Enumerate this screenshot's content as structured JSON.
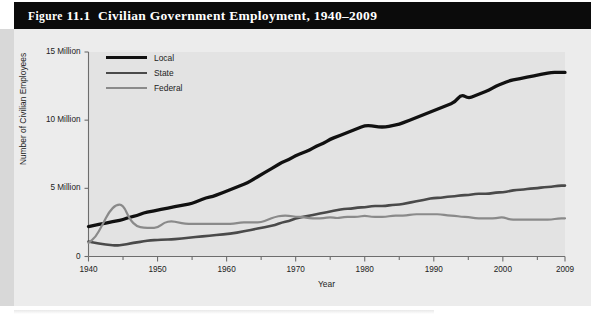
{
  "figure": {
    "label_word": "Figure",
    "number": "11.1",
    "title": "Civilian Government Employment, 1940–2009",
    "title_full": "Figure 11.1  Civilian Government Employment, 1940–2009"
  },
  "colors": {
    "title_bar": "#0b0b0b",
    "title_text": "#ffffff",
    "panel_background": "#ececec",
    "plot_background": "#e3e3e3",
    "axis": "#6d6d6d",
    "local": "#111111",
    "state": "#4a4a4a",
    "federal": "#8a8a8a"
  },
  "legend": {
    "position": "top-left-inside",
    "entries": [
      {
        "label": "Local",
        "color": "#111111",
        "width": 3.3
      },
      {
        "label": "State",
        "color": "#4a4a4a",
        "width": 2.6
      },
      {
        "label": "Federal",
        "color": "#8a8a8a",
        "width": 2.2
      }
    ]
  },
  "chart_data": {
    "type": "line",
    "title": "Civilian Government Employment, 1940–2009",
    "xlabel": "Year",
    "ylabel": "Number of Civilian Employees",
    "xlim": [
      1940,
      2009
    ],
    "ylim": [
      0,
      15
    ],
    "grid": false,
    "units": "millions of employees",
    "xticks": [
      1940,
      1950,
      1960,
      1970,
      1980,
      1990,
      2000,
      2009
    ],
    "xtick_labels": [
      "1940",
      "1950",
      "1960",
      "1970",
      "1980",
      "1990",
      "2000",
      "2009"
    ],
    "xminor_interval": 5,
    "yticks": [
      0,
      5,
      10,
      15
    ],
    "ytick_labels": [
      "0",
      "5 Million",
      "10 Million",
      "15 Million"
    ],
    "x": [
      1940,
      1941,
      1942,
      1943,
      1944,
      1945,
      1946,
      1947,
      1948,
      1949,
      1950,
      1951,
      1952,
      1953,
      1954,
      1955,
      1956,
      1957,
      1958,
      1959,
      1960,
      1961,
      1962,
      1963,
      1964,
      1965,
      1966,
      1967,
      1968,
      1969,
      1970,
      1971,
      1972,
      1973,
      1974,
      1975,
      1976,
      1977,
      1978,
      1979,
      1980,
      1981,
      1982,
      1983,
      1984,
      1985,
      1986,
      1987,
      1988,
      1989,
      1990,
      1991,
      1992,
      1993,
      1994,
      1995,
      1996,
      1997,
      1998,
      1999,
      2000,
      2001,
      2002,
      2003,
      2004,
      2005,
      2006,
      2007,
      2008,
      2009
    ],
    "series": [
      {
        "name": "Local",
        "color": "#111111",
        "values": [
          2.2,
          2.3,
          2.4,
          2.5,
          2.6,
          2.7,
          2.9,
          3.0,
          3.2,
          3.3,
          3.4,
          3.5,
          3.6,
          3.7,
          3.8,
          3.9,
          4.1,
          4.3,
          4.4,
          4.6,
          4.8,
          5.0,
          5.2,
          5.4,
          5.7,
          6.0,
          6.3,
          6.6,
          6.9,
          7.1,
          7.4,
          7.6,
          7.8,
          8.1,
          8.3,
          8.6,
          8.8,
          9.0,
          9.2,
          9.4,
          9.6,
          9.6,
          9.5,
          9.5,
          9.6,
          9.7,
          9.9,
          10.1,
          10.3,
          10.5,
          10.7,
          10.9,
          11.1,
          11.3,
          11.9,
          11.6,
          11.8,
          12.0,
          12.2,
          12.5,
          12.7,
          12.9,
          13.0,
          13.1,
          13.2,
          13.3,
          13.4,
          13.5,
          13.5,
          13.5
        ]
      },
      {
        "name": "State",
        "color": "#4a4a4a",
        "values": [
          1.1,
          1.0,
          0.9,
          0.85,
          0.8,
          0.85,
          0.95,
          1.05,
          1.1,
          1.2,
          1.2,
          1.25,
          1.25,
          1.3,
          1.35,
          1.4,
          1.45,
          1.5,
          1.55,
          1.6,
          1.65,
          1.7,
          1.8,
          1.9,
          2.0,
          2.1,
          2.2,
          2.3,
          2.5,
          2.6,
          2.8,
          2.9,
          3.0,
          3.1,
          3.2,
          3.3,
          3.4,
          3.5,
          3.5,
          3.6,
          3.6,
          3.7,
          3.7,
          3.7,
          3.8,
          3.8,
          3.9,
          4.0,
          4.1,
          4.2,
          4.3,
          4.3,
          4.4,
          4.4,
          4.5,
          4.5,
          4.6,
          4.6,
          4.6,
          4.7,
          4.7,
          4.8,
          4.9,
          4.9,
          5.0,
          5.0,
          5.1,
          5.1,
          5.2,
          5.2
        ]
      },
      {
        "name": "Federal",
        "color": "#8a8a8a",
        "values": [
          1.0,
          1.4,
          2.3,
          3.3,
          3.8,
          3.8,
          2.7,
          2.2,
          2.1,
          2.1,
          2.1,
          2.5,
          2.6,
          2.5,
          2.4,
          2.4,
          2.4,
          2.4,
          2.4,
          2.4,
          2.4,
          2.4,
          2.5,
          2.5,
          2.5,
          2.5,
          2.7,
          2.9,
          3.0,
          3.0,
          2.9,
          2.9,
          2.8,
          2.8,
          2.8,
          2.9,
          2.8,
          2.9,
          2.9,
          2.9,
          3.0,
          2.9,
          2.9,
          2.9,
          3.0,
          3.0,
          3.0,
          3.1,
          3.1,
          3.1,
          3.1,
          3.1,
          3.0,
          3.0,
          2.9,
          2.9,
          2.8,
          2.8,
          2.8,
          2.8,
          2.9,
          2.7,
          2.7,
          2.7,
          2.7,
          2.7,
          2.7,
          2.7,
          2.8,
          2.8
        ]
      }
    ]
  }
}
